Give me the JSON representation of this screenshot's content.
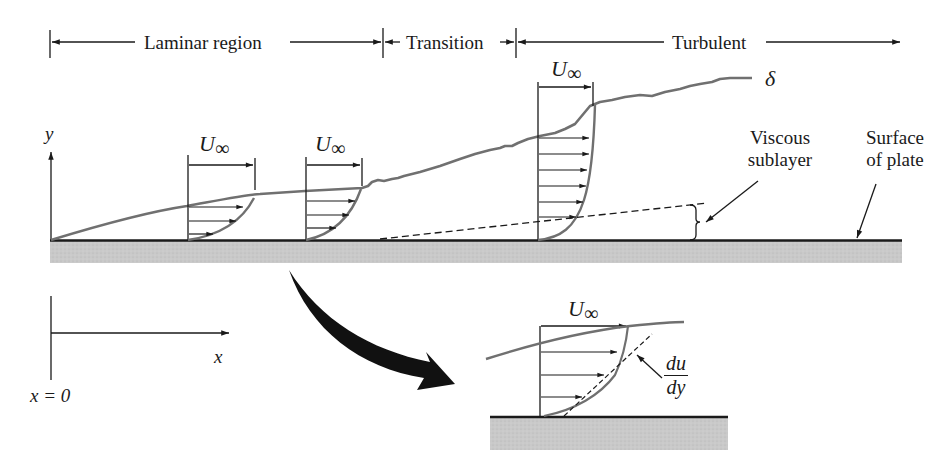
{
  "figure": {
    "regions": [
      {
        "label": "Laminar region",
        "x_start": 50,
        "x_end": 383
      },
      {
        "label": "Transition",
        "x_start": 383,
        "x_end": 516
      },
      {
        "label": "Turbulent",
        "x_start": 516,
        "x_end": 900
      }
    ],
    "velocity_labels": {
      "u_symbol": "U",
      "u_subscript": "∞"
    },
    "boundary_layer_label": "δ",
    "viscous_sublayer_label": [
      "Viscous",
      "sublayer"
    ],
    "surface_label": [
      "Surface",
      "of plate"
    ],
    "axes": {
      "y_label": "y",
      "x_label": "x",
      "origin_label": "x = 0"
    },
    "inset": {
      "gradient_numerator": "du",
      "gradient_denominator": "dy"
    },
    "colors": {
      "ink": "#1a1a1a",
      "profile_curve": "#707070",
      "plate_fill": "#c8c8c8",
      "background": "#ffffff"
    }
  }
}
